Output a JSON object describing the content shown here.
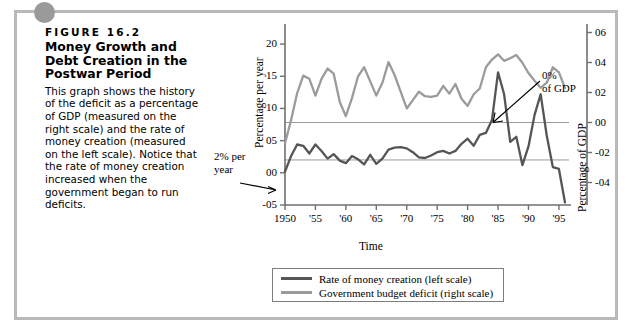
{
  "figure": {
    "label": "FIGURE 16.2",
    "title": "Money Growth and Debt Creation in the Postwar Period",
    "description": "This graph shows the history of the deficit as a percentage of GDP (measured on the right scale) and the rate of money creation (measured on the left scale). Notice that the rate of money creation increased when the government began to run deficits."
  },
  "annotations": {
    "left": "2% per\nyear",
    "right": "0%\nof GDP"
  },
  "legend": {
    "items": [
      {
        "label": "Rate of money creation (left scale)",
        "color": "#555555"
      },
      {
        "label": "Government budget deficit (right scale)",
        "color": "#9b9b9b"
      }
    ]
  },
  "colors": {
    "money_creation": "#555555",
    "budget_deficit": "#9b9b9b",
    "axis": "#6f6f6f",
    "gridline": "#8f8f8f",
    "frame": "#b9b9b9",
    "corner_dot": "#9a9a9a"
  },
  "chart_data": {
    "type": "line",
    "title": "Money Growth and Debt Creation in the Postwar Period",
    "xlabel": "Time",
    "ylabel": "Percentage per year",
    "ylabel_right": "Percentage of GDP",
    "grid": true,
    "legend_position": "bottom",
    "xlim": [
      1950,
      1996
    ],
    "ylim": [
      -5,
      22.5
    ],
    "ylim_right": [
      -5.5,
      6.3
    ],
    "xticks": [
      1950,
      1955,
      1960,
      1965,
      1970,
      1975,
      1980,
      1985,
      1990,
      1995
    ],
    "xticklabels": [
      "1950",
      "'55",
      "'60",
      "'65",
      "'70",
      "'75",
      "'80",
      "'85",
      "'90",
      "'95"
    ],
    "yticks_left": [
      20,
      15,
      10,
      5,
      0,
      -5
    ],
    "yticklabels_left": [
      "20",
      "15",
      "10",
      "05",
      "00",
      "-05"
    ],
    "yticks_right": [
      6,
      4,
      2,
      0,
      -2,
      -4
    ],
    "yticklabels_right": [
      "06",
      "04",
      "02",
      "00",
      "-02",
      "-04"
    ],
    "reference_lines": [
      {
        "value": 2,
        "axis": "left",
        "label": "2% per year"
      },
      {
        "value": 0,
        "axis": "right",
        "label": "0% of GDP"
      }
    ],
    "series": [
      {
        "name": "Government budget deficit (right scale)",
        "axis": "left",
        "color": "#9b9b9b",
        "x": [
          1950,
          1951,
          1952,
          1953,
          1954,
          1955,
          1956,
          1957,
          1958,
          1959,
          1960,
          1961,
          1962,
          1963,
          1964,
          1965,
          1966,
          1967,
          1968,
          1969,
          1970,
          1971,
          1972,
          1973,
          1974,
          1975,
          1976,
          1977,
          1978,
          1979,
          1980,
          1981,
          1982,
          1983,
          1984,
          1985,
          1986,
          1987,
          1988,
          1989,
          1990,
          1991,
          1992,
          1993,
          1994,
          1995,
          1996
        ],
        "values": [
          4.6,
          8.2,
          12.4,
          15.1,
          14.6,
          12.0,
          14.6,
          16.2,
          15.4,
          11.0,
          8.8,
          11.6,
          15.0,
          16.4,
          14.2,
          12.0,
          14.0,
          17.2,
          15.2,
          12.6,
          10.0,
          11.3,
          12.6,
          11.9,
          11.8,
          12.0,
          13.5,
          12.3,
          13.8,
          11.5,
          10.4,
          12.2,
          13.1,
          16.4,
          17.6,
          18.4,
          17.4,
          17.8,
          18.3,
          17.1,
          15.5,
          14.3,
          13.2,
          14.0,
          16.4,
          15.6,
          13.2
        ]
      },
      {
        "name": "Rate of money creation (left scale)",
        "axis": "left",
        "color": "#555555",
        "x": [
          1950,
          1951,
          1952,
          1953,
          1954,
          1955,
          1956,
          1957,
          1958,
          1959,
          1960,
          1961,
          1962,
          1963,
          1964,
          1965,
          1966,
          1967,
          1968,
          1969,
          1970,
          1971,
          1972,
          1973,
          1974,
          1975,
          1976,
          1977,
          1978,
          1979,
          1980,
          1981,
          1982,
          1983,
          1984,
          1985,
          1986,
          1987,
          1988,
          1989,
          1990,
          1991,
          1992,
          1993,
          1994,
          1995,
          1996
        ],
        "values": [
          0.2,
          2.6,
          4.4,
          4.2,
          3.0,
          4.4,
          3.4,
          2.2,
          2.9,
          1.9,
          1.5,
          2.6,
          2.1,
          1.3,
          2.8,
          1.4,
          2.2,
          3.6,
          3.9,
          4.0,
          3.8,
          3.2,
          2.4,
          2.3,
          2.7,
          3.2,
          3.4,
          3.0,
          3.4,
          4.5,
          5.3,
          4.2,
          5.9,
          6.2,
          8.2,
          15.6,
          12.2,
          4.8,
          5.6,
          1.2,
          4.1,
          9.0,
          12.2,
          5.8,
          0.9,
          0.6,
          -4.6
        ]
      }
    ]
  }
}
